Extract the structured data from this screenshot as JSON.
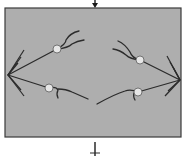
{
  "diagram": {
    "type": "schematic",
    "colors": {
      "background": "#ffffff",
      "panel_fill": "#aeaeae",
      "panel_border": "#3a3a3a",
      "line": "#2b2b2b",
      "joint_fill": "#e6e6e6",
      "joint_stroke": "#5a5a5a"
    },
    "panel": {
      "x": 5,
      "y": 8,
      "width": 178,
      "height": 129
    },
    "input_arrow": {
      "x": 95,
      "y1": 0,
      "y2": 8,
      "icon": "arrow-down-icon"
    },
    "output_stem": {
      "x": 95,
      "y1": 140,
      "y2": 156,
      "tick_y": 152
    },
    "joints": [
      {
        "name": "upper-left-joint",
        "cx": 57,
        "cy": 49,
        "r": 4
      },
      {
        "name": "lower-left-joint",
        "cx": 49,
        "cy": 88,
        "r": 4
      },
      {
        "name": "upper-right-joint",
        "cx": 140,
        "cy": 60,
        "r": 4
      },
      {
        "name": "lower-right-joint",
        "cx": 138,
        "cy": 92,
        "r": 4
      }
    ]
  }
}
